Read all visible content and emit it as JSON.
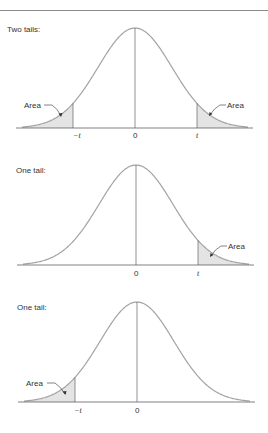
{
  "figure": {
    "panels": [
      {
        "title": "Two tails:",
        "shaded": "both",
        "area_label": "Area",
        "ticks": {
          "neg": "−t",
          "zero": "0",
          "pos": "t"
        },
        "center_x": 135,
        "baseline_y": 128,
        "peak_y": 28
      },
      {
        "title": "One tail:",
        "shaded": "right",
        "area_label": "Area",
        "ticks": {
          "zero": "0",
          "pos": "t"
        },
        "center_x": 136,
        "baseline_y": 265,
        "peak_y": 165
      },
      {
        "title": "One tail:",
        "shaded": "left",
        "area_label": "Area",
        "ticks": {
          "neg": "−t",
          "zero": "0"
        },
        "center_x": 137,
        "baseline_y": 402,
        "peak_y": 302
      }
    ],
    "colors": {
      "curve": "#a3a3a3",
      "shade": "#e4e4e4",
      "axis": "#4a4a4a",
      "rule": "#8a8a8a"
    }
  }
}
